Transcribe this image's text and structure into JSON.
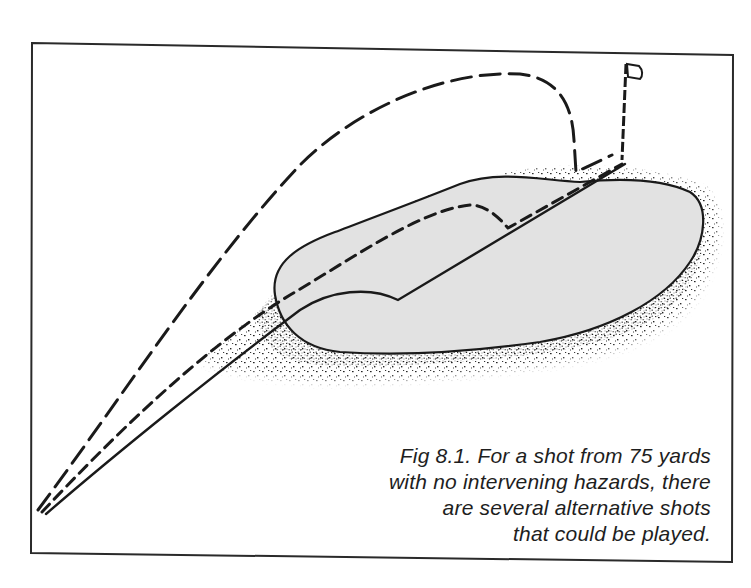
{
  "figure": {
    "caption_lines": [
      "Fig 8.1. For a shot from 75 yards",
      "with no intervening hazards, there",
      "are several alternative shots",
      "that could be played."
    ],
    "elements": {
      "green": "putting green (light grey fill)",
      "rough": "stippled fringe/rough around the green",
      "flag": "flagstick with pennant",
      "shots": [
        {
          "name": "high-pitch",
          "style": "long-dash",
          "description": "high lofted pitch landing near the pin with little run"
        },
        {
          "name": "pitch-and-run",
          "style": "short-dash",
          "description": "medium pitch landing mid-green then rolling to the pin"
        },
        {
          "name": "chip-and-run",
          "style": "solid",
          "description": "low running shot bouncing short of green and rolling to the pin"
        }
      ]
    },
    "colors": {
      "ink": "#1a1a1a",
      "green_fill": "#e2e2e2",
      "paper": "#ffffff"
    }
  }
}
